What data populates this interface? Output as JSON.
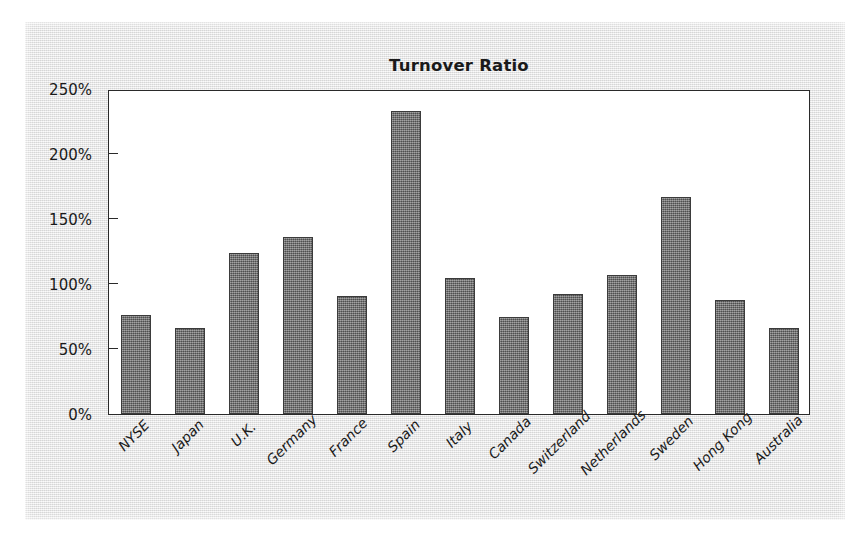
{
  "chart_data": {
    "type": "bar",
    "title": "Turnover Ratio",
    "xlabel": "",
    "ylabel": "",
    "ylim": [
      0,
      250
    ],
    "ytick_labels": [
      "250%",
      "200%",
      "150%",
      "100%",
      "50%",
      "0%"
    ],
    "ytick_values": [
      250,
      200,
      150,
      100,
      50,
      0
    ],
    "grid": false,
    "legend": null,
    "unit": "%",
    "categories": [
      "NYSE",
      "Japan",
      "U.K.",
      "Germany",
      "France",
      "Spain",
      "Italy",
      "Canada",
      "Switzerland",
      "Netherlands",
      "Sweden",
      "Hong Kong",
      "Australia"
    ],
    "values": [
      76,
      66,
      124,
      136,
      91,
      233,
      105,
      75,
      92,
      107,
      167,
      88,
      66
    ]
  },
  "style": {
    "bar_color": "#6e6e6e",
    "bar_edge_color": "#3b3b3b",
    "axis_color": "#2a2a2a",
    "plot_background": "#ffffff",
    "panel_background": "#e9e9e9",
    "text_color": "#1a1a1a"
  }
}
